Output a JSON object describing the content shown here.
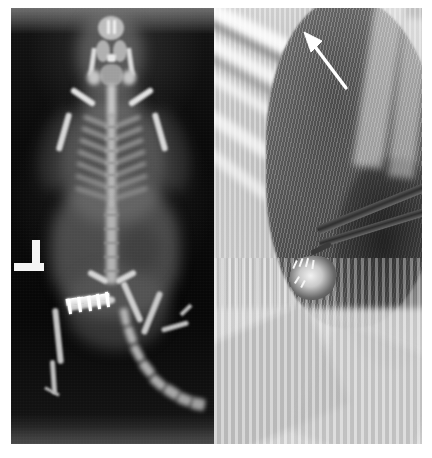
{
  "figure": {
    "background_color": "#ffffff",
    "width_px": 432,
    "height_px": 458,
    "panel_count": 2,
    "caption": ""
  },
  "panels": [
    {
      "id": "panel-a",
      "name": "radiograph",
      "label": "",
      "modality": "X-ray radiograph",
      "view": "dorsoventral whole-body",
      "subject": "rodent",
      "background_color": "#0a0a0a",
      "bone_color": "#cfcfcf",
      "position": {
        "left_px": 11,
        "top_px": 8,
        "width_px": 203,
        "height_px": 436
      },
      "markers": [
        {
          "name": "radiographic-left-marker",
          "glyph": "L",
          "color": "#f4f4f4",
          "left_px": 3,
          "top_px": 232
        }
      ],
      "anatomy": [
        "skull",
        "mandible",
        "cervical spine",
        "scapula",
        "ribcage",
        "thoracic spine",
        "lumbar spine",
        "pelvis",
        "femur",
        "tibia",
        "hind paw",
        "caudal vertebrae (tail)"
      ],
      "implant": {
        "name": "bone-plate-implant",
        "type": "internal fixation plate",
        "location": "left femur",
        "screw_count": 5,
        "color": "#ffffff"
      }
    },
    {
      "id": "panel-b",
      "name": "intraoperative-photograph",
      "label": "",
      "modality": "grayscale photograph",
      "view": "surgical field close-up",
      "background_color": "#c4c4c4",
      "position": {
        "left_px": 214,
        "top_px": 8,
        "width_px": 208,
        "height_px": 436
      },
      "contents": [
        "surgical drape",
        "animal fur",
        "surgical incision site",
        "sutures",
        "forceps instrument"
      ],
      "annotations": [
        {
          "name": "arrow-annotation",
          "shape": "arrow",
          "color": "#ffffff",
          "direction": "up-left",
          "points_to": "surgical implant site",
          "left_px": 86,
          "top_px": 22
        }
      ]
    }
  ]
}
